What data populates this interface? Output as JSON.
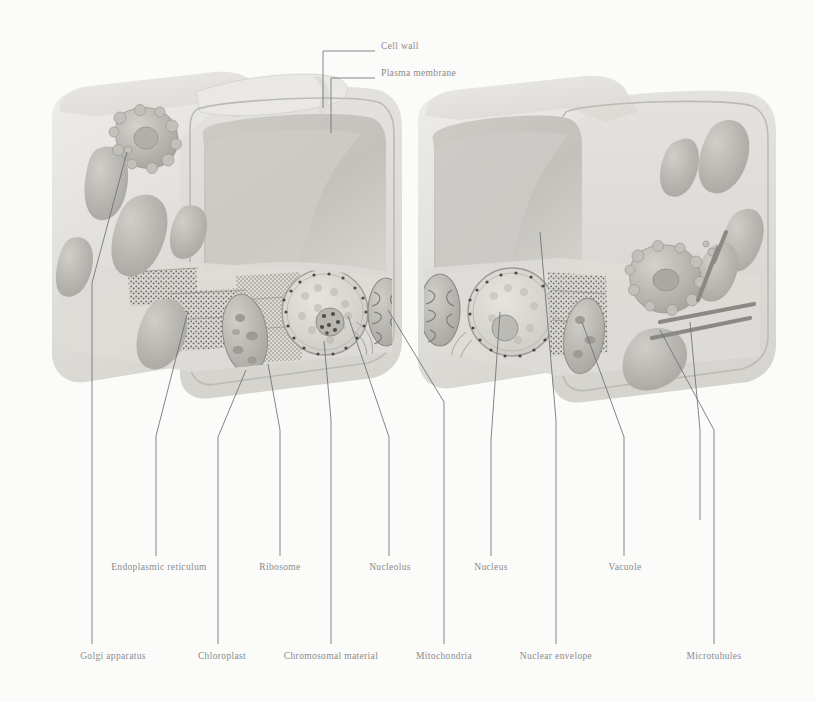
{
  "figure": {
    "kind": "biology-illustration",
    "palette": {
      "background": "#fbfbfa",
      "cell_wall": "#e4e3df",
      "cell_wall_shade": "#d2d1cc",
      "cytoplasm": "#dcdbd6",
      "vacuole": "#c9c8c3",
      "vacuole_shade": "#bdbcb7",
      "organelle": "#c3c2bd",
      "organelle_dark": "#a9a8a3",
      "nucleus_fill": "#dedcd7",
      "nucleolus": "#9e9d98",
      "leader_line": "#6f6f71",
      "label_text": "#8a8a8c",
      "stipple": "#6b6a66"
    }
  },
  "top_labels": [
    {
      "id": "cell-wall",
      "text": "Cell wall",
      "text_x": 381,
      "text_y": 47,
      "leader": "M 323,108 L 323,51 L 375,51"
    },
    {
      "id": "plasma-membrane",
      "text": "Plasma membrane",
      "text_x": 381,
      "text_y": 74,
      "leader": "M 331,133 L 331,78 L 375,78"
    }
  ],
  "bottom_labels": [
    {
      "id": "golgi-apparatus",
      "text": "Golgi apparatus",
      "text_x": 113,
      "text_y": 657,
      "row": "lower",
      "leader": "M 127,152 L 92,283 L 92,644"
    },
    {
      "id": "endoplasmic-reticulum",
      "text": "Endoplasmic reticulum",
      "text_x": 159,
      "text_y": 568,
      "row": "upper",
      "leader": "M 188,311 L 156,436 L 156,556"
    },
    {
      "id": "chloroplast",
      "text": "Chloroplast",
      "text_x": 222,
      "text_y": 657,
      "row": "lower",
      "leader": "M 246,370 L 218,437 L 218,644"
    },
    {
      "id": "ribosome",
      "text": "Ribosome",
      "text_x": 280,
      "text_y": 568,
      "row": "upper",
      "leader": "M 268,364 L 280,430 L 280,556"
    },
    {
      "id": "chromosomal-material",
      "text": "Chromosomal material",
      "text_x": 331,
      "text_y": 657,
      "row": "lower",
      "leader": "M 324,341 L 331,420 L 331,644"
    },
    {
      "id": "nucleolus",
      "text": "Nucleolus",
      "text_x": 390,
      "text_y": 568,
      "row": "upper",
      "leader": "M 348,316 L 389,437 L 389,556"
    },
    {
      "id": "mitochondria",
      "text": "Mitochondria",
      "text_x": 444,
      "text_y": 657,
      "row": "lower",
      "leader": "M 388,310 L 444,402 L 444,644"
    },
    {
      "id": "nucleus",
      "text": "Nucleus",
      "text_x": 491,
      "text_y": 568,
      "row": "upper",
      "leader": "M 500,312 L 491,440 L 491,556"
    },
    {
      "id": "nuclear-envelope",
      "text": "Nuclear envelope",
      "text_x": 556,
      "text_y": 657,
      "row": "lower",
      "leader": "M 540,232 L 556,420 L 556,644"
    },
    {
      "id": "vacuole",
      "text": "Vacuole",
      "text_x": 625,
      "text_y": 568,
      "row": "upper",
      "leader": "M 582,322 L 624,437 L 624,556"
    },
    {
      "id": "microtubules",
      "text": "Microtubules",
      "text_x": 714,
      "text_y": 657,
      "row": "lower",
      "leader": "M 660,330 L 714,430 L 714,644"
    },
    {
      "id": "microtubules-second",
      "text": "",
      "text_x": 0,
      "text_y": 0,
      "row": "none",
      "leader": "M 690,322 L 700,430 L 700,520"
    }
  ],
  "structures": {
    "left_cell": {
      "name": "left-plant-cell",
      "organelles": [
        "golgi apparatus",
        "chloroplasts",
        "endoplasmic reticulum",
        "ribosomes",
        "nucleus",
        "nucleolus",
        "chromosomal material",
        "mitochondrion",
        "vacuole",
        "cell wall",
        "plasma membrane"
      ]
    },
    "right_cell": {
      "name": "right-plant-cell",
      "organelles": [
        "mitochondrion",
        "nucleus",
        "nucleolus",
        "nuclear envelope",
        "vacuole",
        "golgi apparatus",
        "microtubules",
        "chloroplasts",
        "cell wall",
        "plasma membrane"
      ]
    }
  }
}
